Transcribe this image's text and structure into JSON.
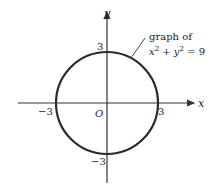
{
  "diagram": {
    "axes": {
      "x_label": "x",
      "y_label": "y",
      "origin_label": "O"
    },
    "ticks": {
      "x_pos": "3",
      "x_neg": "−3",
      "y_pos": "3",
      "y_neg": "−3"
    },
    "annotation": {
      "line1": "graph of",
      "equation_x": "x",
      "equation_plus": " + ",
      "equation_y": "y",
      "equation_exp": "2",
      "equation_rhs": " = 9"
    },
    "colors": {
      "curve": "#2a2a2a",
      "axis": "#333333"
    }
  }
}
